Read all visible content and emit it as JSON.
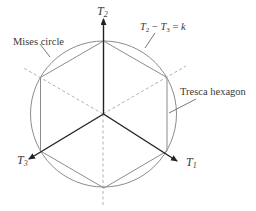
{
  "diagram": {
    "axes": [
      {
        "id": "T2",
        "symbol": "T",
        "subscript": "2"
      },
      {
        "id": "T1",
        "symbol": "T",
        "subscript": "1"
      },
      {
        "id": "T3",
        "symbol": "T",
        "subscript": "3"
      }
    ],
    "labels": {
      "mises": "Mises circle",
      "tresca": "Tresca hexagon",
      "eq_T1": "T",
      "eq_sub1": "2",
      "eq_minus": " − ",
      "eq_T2": "T",
      "eq_sub2": "3",
      "eq_equals": " = ",
      "eq_k": "k"
    },
    "colors": {
      "axis": "#222222",
      "curve": "#8c8c8c",
      "dashed": "#a8a8a8",
      "text": "#3a3a3a"
    }
  }
}
